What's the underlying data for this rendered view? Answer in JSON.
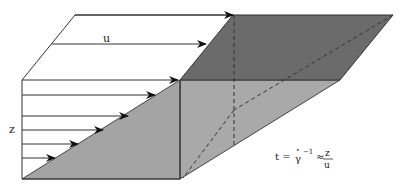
{
  "diagram": {
    "labels": {
      "velocity": "u",
      "height": "z",
      "equation_lhs": "t =",
      "equation_gamma": "γ",
      "equation_dot": "•",
      "equation_exp": "−1",
      "equation_approx": "≈",
      "equation_num": "z",
      "equation_den": "u"
    },
    "colors": {
      "top_face": "#6b6b6b",
      "side_face": "#a9a9a9",
      "front_triangle": "#a4a4a4",
      "lines": "#333333"
    },
    "arrows_front": [
      {
        "y": 80,
        "tip_x": 178
      },
      {
        "y": 95,
        "tip_x": 155
      },
      {
        "y": 116,
        "tip_x": 128
      },
      {
        "y": 130,
        "tip_x": 103
      },
      {
        "y": 144,
        "tip_x": 78
      },
      {
        "y": 158,
        "tip_x": 55
      }
    ]
  }
}
